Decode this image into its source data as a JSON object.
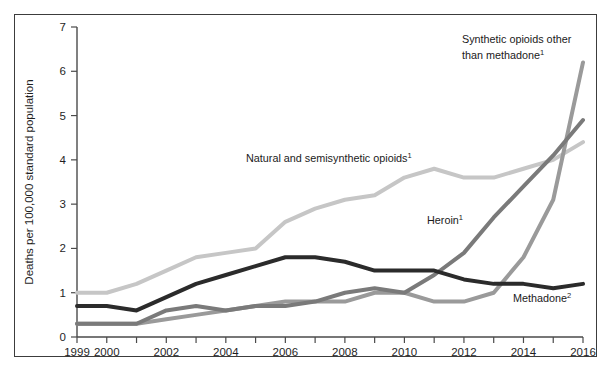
{
  "figure": {
    "background_color": "#ffffff",
    "frame_color": "#3c3c3c"
  },
  "chart_data": {
    "type": "line",
    "title": "",
    "subtitle": "",
    "xlabel": "",
    "ylabel": "Deaths per 100,000 standard population",
    "x": [
      1999,
      2000,
      2001,
      2002,
      2003,
      2004,
      2005,
      2006,
      2007,
      2008,
      2009,
      2010,
      2011,
      2012,
      2013,
      2014,
      2015,
      2016
    ],
    "xlim": [
      1999,
      2016
    ],
    "ylim": [
      0,
      7
    ],
    "xticks": [
      1999,
      2000,
      2001,
      2002,
      2003,
      2004,
      2005,
      2006,
      2007,
      2008,
      2009,
      2010,
      2011,
      2012,
      2013,
      2014,
      2015,
      2016
    ],
    "xtick_labels": [
      "1999",
      "2000",
      "",
      "2002",
      "",
      "2004",
      "",
      "2006",
      "",
      "2008",
      "",
      "2010",
      "",
      "2012",
      "",
      "2014",
      "",
      "2016"
    ],
    "yticks": [
      0,
      1,
      2,
      3,
      4,
      5,
      6,
      7
    ],
    "ytick_labels": [
      "0",
      "1",
      "2",
      "3",
      "4",
      "5",
      "6",
      "7"
    ],
    "grid": false,
    "legend_position": "inline-annotations",
    "series": [
      {
        "name": "Natural and semisynthetic opioids",
        "footnote": "1",
        "color": "#c6c6c6",
        "stroke_width": 4.0,
        "values": [
          1.0,
          1.0,
          1.2,
          1.5,
          1.8,
          1.9,
          2.0,
          2.6,
          2.9,
          3.1,
          3.2,
          3.6,
          3.8,
          3.6,
          3.6,
          3.8,
          4.0,
          4.4
        ]
      },
      {
        "name": "Methadone",
        "footnote": "2",
        "color": "#2b2b2b",
        "stroke_width": 4.0,
        "values": [
          0.7,
          0.7,
          0.6,
          0.9,
          1.2,
          1.4,
          1.6,
          1.8,
          1.8,
          1.7,
          1.5,
          1.5,
          1.5,
          1.3,
          1.2,
          1.2,
          1.1,
          1.2
        ]
      },
      {
        "name": "Heroin",
        "footnote": "1",
        "color": "#7a7a7a",
        "stroke_width": 4.0,
        "values": [
          0.3,
          0.3,
          0.3,
          0.6,
          0.7,
          0.6,
          0.7,
          0.7,
          0.8,
          1.0,
          1.1,
          1.0,
          1.4,
          1.9,
          2.7,
          3.4,
          4.1,
          4.9
        ]
      },
      {
        "name": "Synthetic opioids other than methadone",
        "footnote": "1",
        "color": "#9a9a9a",
        "stroke_width": 4.0,
        "values": [
          0.3,
          0.3,
          0.3,
          0.4,
          0.5,
          0.6,
          0.7,
          0.8,
          0.8,
          0.8,
          1.0,
          1.0,
          0.8,
          0.8,
          1.0,
          1.8,
          3.1,
          6.2
        ]
      }
    ]
  },
  "annotations": [
    {
      "id": "natural-semisynthetic",
      "text": "Natural and semisynthetic opioids",
      "footnote": "1",
      "x": 246,
      "y": 162
    },
    {
      "id": "synthetic-other-than-methadone-line1",
      "text": "Synthetic opioids other",
      "footnote": "",
      "x": 462,
      "y": 43
    },
    {
      "id": "synthetic-other-than-methadone-line2",
      "text": "than methadone",
      "footnote": "1",
      "x": 462,
      "y": 59
    },
    {
      "id": "heroin",
      "text": "Heroin",
      "footnote": "1",
      "x": 427,
      "y": 224
    },
    {
      "id": "methadone",
      "text": "Methadone",
      "footnote": "2",
      "x": 513,
      "y": 302
    }
  ],
  "axis_title": {
    "y": "Deaths per 100,000 standard population"
  }
}
